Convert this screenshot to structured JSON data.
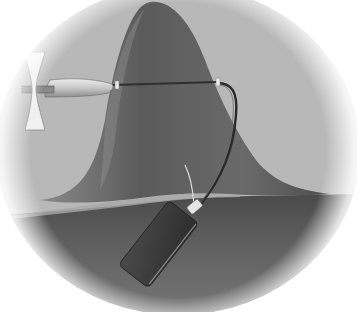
{
  "image": {
    "description": "Grayscale illustration of a probe with propeller-like tip and cable inserted into a bell-shaped tissue mound, connected to a small rectangular device, vignetted in a soft circle",
    "palette": {
      "background": "#ffffff",
      "backdrop": "#b9b9b9",
      "mound_dark": "#5a5a5a",
      "mound_mid": "#7a7a7a",
      "floor_dark": "#4a4a4a",
      "floor_mid": "#6e6e6e",
      "probe_body": "#cfcfcf",
      "probe_tip": "#e8e8e8",
      "cable": "#2a2a2a",
      "device": "#3a3a3a",
      "device_edge": "#9a9a9a",
      "connector": "#e0e0e0"
    },
    "elements": [
      "vignette-circle",
      "bell-shaped-mound",
      "floor-surface",
      "probe-propeller-tip",
      "probe-body",
      "probe-shaft",
      "cable",
      "device-box",
      "device-connector"
    ]
  }
}
